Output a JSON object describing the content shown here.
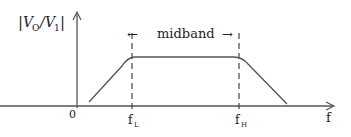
{
  "diagram": {
    "y_axis_label_num": "V",
    "y_axis_label_num_sub": "O",
    "y_axis_label_den": "V",
    "y_axis_label_den_sub": "1",
    "y_axis_label_bar": "|",
    "x_axis_label": "f",
    "origin_label": "0",
    "f_low_label": "f",
    "f_low_sub": "L",
    "f_high_label": "f",
    "f_high_sub": "H",
    "band_label": "midband",
    "arrow_left": "←",
    "arrow_right": "→",
    "line_color": "#555555"
  }
}
